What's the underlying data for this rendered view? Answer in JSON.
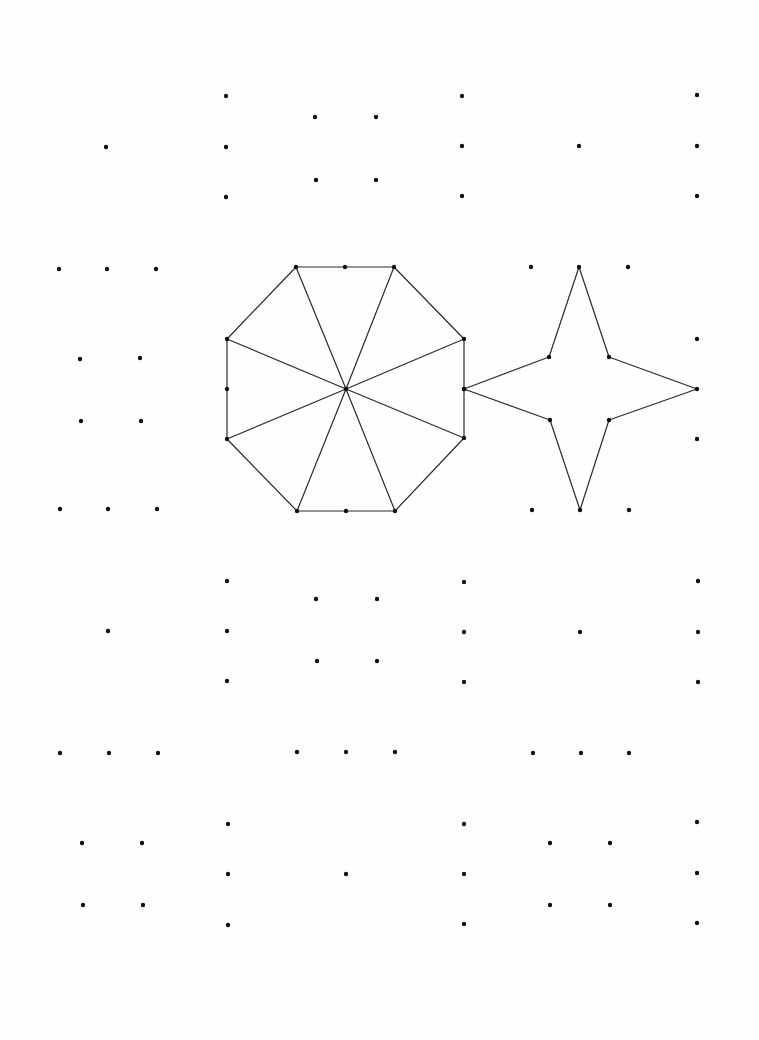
{
  "page": {
    "width": 759,
    "height": 1040,
    "background": "#fefefe",
    "dot_color": "#111111",
    "line_color": "#2a2a2a",
    "dot_radius": 2.2
  },
  "dot_groups": [
    {
      "name": "top-left-cluster",
      "points": [
        [
          106,
          147
        ]
      ]
    },
    {
      "name": "top-center-left-cluster",
      "points": [
        [
          226,
          96
        ],
        [
          226,
          147
        ],
        [
          226,
          197
        ],
        [
          315,
          117
        ],
        [
          376,
          117
        ],
        [
          316,
          180
        ],
        [
          376,
          180
        ]
      ]
    },
    {
      "name": "top-center-right-cluster",
      "points": [
        [
          462,
          96
        ],
        [
          462,
          146
        ],
        [
          462,
          196
        ],
        [
          579,
          146
        ]
      ]
    },
    {
      "name": "top-right-cluster",
      "points": [
        [
          697,
          95
        ],
        [
          697,
          146
        ],
        [
          697,
          196
        ]
      ]
    },
    {
      "name": "middle-left-cluster",
      "points": [
        [
          59,
          269
        ],
        [
          107,
          269
        ],
        [
          156,
          269
        ],
        [
          80,
          359
        ],
        [
          140,
          358
        ],
        [
          81,
          421
        ],
        [
          141,
          421
        ],
        [
          60,
          509
        ],
        [
          108,
          509
        ],
        [
          157,
          509
        ]
      ]
    },
    {
      "name": "middle-right-extra-dots",
      "points": [
        [
          531,
          267
        ],
        [
          628,
          267
        ],
        [
          697,
          339
        ],
        [
          697,
          439
        ],
        [
          532,
          510
        ],
        [
          629,
          510
        ]
      ]
    },
    {
      "name": "lower-center-left-cluster",
      "points": [
        [
          108,
          631
        ],
        [
          227,
          581
        ],
        [
          227,
          631
        ],
        [
          227,
          681
        ],
        [
          316,
          599
        ],
        [
          377,
          599
        ],
        [
          317,
          661
        ],
        [
          377,
          661
        ]
      ]
    },
    {
      "name": "lower-center-right-cluster",
      "points": [
        [
          464,
          582
        ],
        [
          464,
          632
        ],
        [
          464,
          682
        ],
        [
          580,
          632
        ],
        [
          698,
          581
        ],
        [
          698,
          632
        ],
        [
          698,
          682
        ]
      ]
    },
    {
      "name": "lower-row-dots",
      "points": [
        [
          60,
          753
        ],
        [
          109,
          753
        ],
        [
          158,
          753
        ],
        [
          297,
          752
        ],
        [
          346,
          752
        ],
        [
          395,
          752
        ],
        [
          533,
          753
        ],
        [
          581,
          753
        ],
        [
          629,
          753
        ]
      ]
    },
    {
      "name": "bottom-left-cluster",
      "points": [
        [
          82,
          843
        ],
        [
          142,
          843
        ],
        [
          83,
          905
        ],
        [
          143,
          905
        ],
        [
          228,
          824
        ],
        [
          228,
          874
        ],
        [
          228,
          925
        ],
        [
          346,
          874
        ]
      ]
    },
    {
      "name": "bottom-right-cluster",
      "points": [
        [
          464,
          824
        ],
        [
          464,
          874
        ],
        [
          464,
          924
        ],
        [
          550,
          843
        ],
        [
          610,
          843
        ],
        [
          550,
          905
        ],
        [
          610,
          905
        ],
        [
          697,
          822
        ],
        [
          697,
          873
        ],
        [
          697,
          923
        ]
      ]
    }
  ],
  "shapes": {
    "octagon": {
      "label": "octagon-with-radial-spokes",
      "center": [
        346,
        389
      ],
      "vertices": [
        [
          296,
          267
        ],
        [
          394,
          267
        ],
        [
          464,
          339
        ],
        [
          464,
          438
        ],
        [
          395,
          511
        ],
        [
          297,
          511
        ],
        [
          227,
          439
        ],
        [
          227,
          339
        ]
      ],
      "edge_midpoints": [
        [
          345,
          267
        ],
        [
          464,
          389
        ],
        [
          346,
          511
        ],
        [
          227,
          389
        ]
      ],
      "spokes_to": [
        [
          296,
          267
        ],
        [
          394,
          267
        ],
        [
          464,
          339
        ],
        [
          464,
          438
        ],
        [
          395,
          511
        ],
        [
          297,
          511
        ],
        [
          227,
          439
        ],
        [
          227,
          339
        ]
      ]
    },
    "star": {
      "label": "four-point-star",
      "vertices": [
        [
          579,
          267
        ],
        [
          609,
          357
        ],
        [
          697,
          389
        ],
        [
          609,
          420
        ],
        [
          580,
          510
        ],
        [
          550,
          420
        ],
        [
          464,
          389
        ],
        [
          549,
          357
        ]
      ]
    }
  }
}
